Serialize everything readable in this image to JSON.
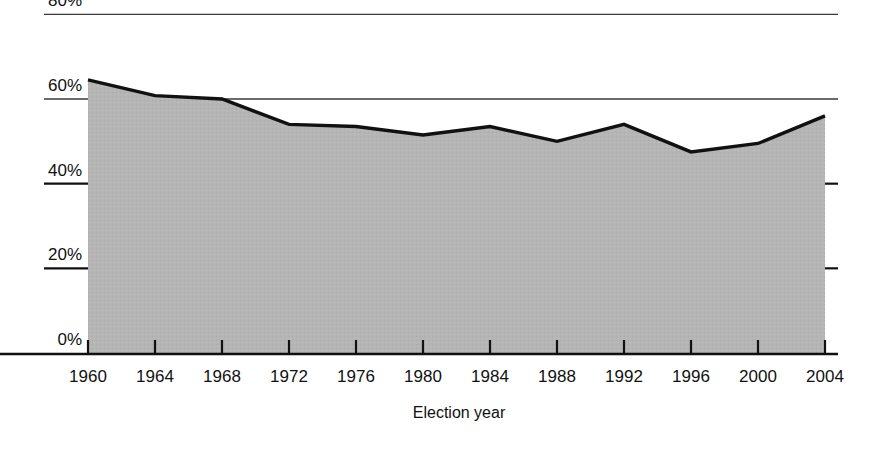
{
  "chart_data": {
    "type": "area",
    "title": "",
    "subtitle": "",
    "xlabel": "Election year",
    "ylabel": "",
    "categories": [
      "1960",
      "1964",
      "1968",
      "1972",
      "1976",
      "1980",
      "1984",
      "1988",
      "1992",
      "1996",
      "2000",
      "2004"
    ],
    "x": [
      1960,
      1964,
      1968,
      1972,
      1976,
      1980,
      1984,
      1988,
      1992,
      1996,
      2000,
      2004
    ],
    "values": [
      64.5,
      60.8,
      60.0,
      54.0,
      53.5,
      51.5,
      53.5,
      50.0,
      54.0,
      47.5,
      49.5,
      56.0
    ],
    "series": [
      {
        "name": "Voter turnout",
        "values": [
          64.5,
          60.8,
          60.0,
          54.0,
          53.5,
          51.5,
          53.5,
          50.0,
          54.0,
          47.5,
          49.5,
          56.0
        ]
      }
    ],
    "ylim": [
      0,
      80
    ],
    "xlim": [
      1960,
      2004
    ],
    "ytick_labels": [
      "0%",
      "20%",
      "40%",
      "60%",
      "80%"
    ],
    "ytick_values": [
      0,
      20,
      40,
      60,
      80
    ],
    "xtick_labels": [
      "1960",
      "1964",
      "1968",
      "1972",
      "1976",
      "1980",
      "1984",
      "1988",
      "1992",
      "1996",
      "2000",
      "2004"
    ],
    "grid": true,
    "grid_note": "Horizontal rules at 60% and 80% span the full plot width; 20% and 40% show short ticks at left and right edges only.",
    "legend": "none",
    "legend_position": "none",
    "area_fill_color": "#b5b5b5",
    "line_color": "#111111",
    "background_color": "#ffffff",
    "axis_color": "#111111"
  },
  "axes": {
    "y_labels": [
      {
        "text": "0%",
        "value": 0
      },
      {
        "text": "20%",
        "value": 20
      },
      {
        "text": "40%",
        "value": 40
      },
      {
        "text": "60%",
        "value": 60
      },
      {
        "text": "80%",
        "value": 80
      }
    ],
    "x_labels": [
      {
        "text": "1960",
        "value": 1960
      },
      {
        "text": "1964",
        "value": 1964
      },
      {
        "text": "1968",
        "value": 1968
      },
      {
        "text": "1972",
        "value": 1972
      },
      {
        "text": "1976",
        "value": 1976
      },
      {
        "text": "1980",
        "value": 1980
      },
      {
        "text": "1984",
        "value": 1984
      },
      {
        "text": "1988",
        "value": 1988
      },
      {
        "text": "1992",
        "value": 1992
      },
      {
        "text": "1996",
        "value": 1996
      },
      {
        "text": "2000",
        "value": 2000
      },
      {
        "text": "2004",
        "value": 2004
      }
    ],
    "x_axis_title": "Election year"
  }
}
